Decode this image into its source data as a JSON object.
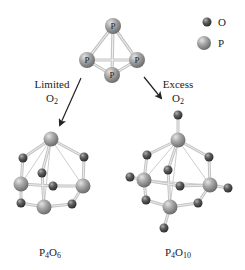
{
  "legend": {
    "items": [
      {
        "symbol": "O",
        "label": "O",
        "sphere": "small-dark-gray"
      },
      {
        "symbol": "P",
        "label": "P",
        "sphere": "large-light-gray"
      }
    ]
  },
  "reactant": {
    "name": "P4",
    "atom_label": "P",
    "atoms": [
      "P",
      "P",
      "P",
      "P"
    ]
  },
  "paths": {
    "left": {
      "condition_line1": "Limited",
      "condition_line2_base": "O",
      "condition_line2_sub": "2"
    },
    "right": {
      "condition_line1": "Excess",
      "condition_line2_base": "O",
      "condition_line2_sub": "2"
    }
  },
  "products": {
    "left": {
      "formula_p": "P",
      "formula_p_sub": "4",
      "formula_o": "O",
      "formula_o_sub": "6"
    },
    "right": {
      "formula_p": "P",
      "formula_p_sub": "4",
      "formula_o": "O",
      "formula_o_sub": "10"
    }
  },
  "colors": {
    "phosphorus": "#9a9a9a",
    "oxygen": "#5a5a5a",
    "bond": "#c8c8c8",
    "text": "#222222",
    "arrow": "#222222"
  }
}
